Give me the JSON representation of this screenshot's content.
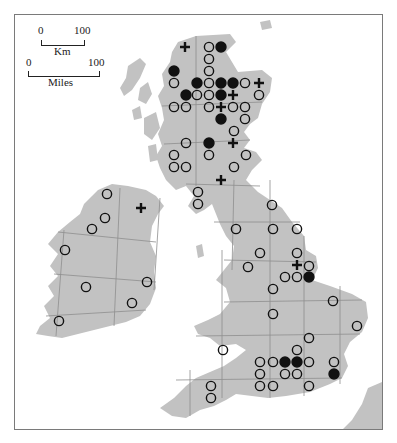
{
  "map": {
    "land_color": "#c2c2c2",
    "grid_color": "#8e8e8e",
    "frame_color": "#7a7a7a",
    "symbol_color": "#111111"
  },
  "scale_bars": {
    "km": {
      "start": "0",
      "end": "100",
      "unit": "Km"
    },
    "miles": {
      "start": "0",
      "end": "100",
      "unit": "Miles"
    }
  },
  "legend_symbols": {
    "open_circle": "open-circle",
    "filled_circle": "filled-circle",
    "plus": "plus"
  },
  "points": [
    {
      "t": "plus",
      "x": 185,
      "y": 47
    },
    {
      "t": "open",
      "x": 209,
      "y": 47
    },
    {
      "t": "filled",
      "x": 221,
      "y": 47
    },
    {
      "t": "open",
      "x": 209,
      "y": 59
    },
    {
      "t": "filled",
      "x": 174,
      "y": 71
    },
    {
      "t": "open",
      "x": 209,
      "y": 71
    },
    {
      "t": "open",
      "x": 174,
      "y": 83
    },
    {
      "t": "filled",
      "x": 197,
      "y": 83
    },
    {
      "t": "open",
      "x": 209,
      "y": 83
    },
    {
      "t": "filled",
      "x": 221,
      "y": 83
    },
    {
      "t": "filled",
      "x": 233,
      "y": 83
    },
    {
      "t": "open",
      "x": 245,
      "y": 83
    },
    {
      "t": "plus",
      "x": 259,
      "y": 83
    },
    {
      "t": "filled",
      "x": 186,
      "y": 95
    },
    {
      "t": "open",
      "x": 197,
      "y": 95
    },
    {
      "t": "open",
      "x": 209,
      "y": 95
    },
    {
      "t": "filled",
      "x": 221,
      "y": 95
    },
    {
      "t": "plus",
      "x": 233,
      "y": 95
    },
    {
      "t": "open",
      "x": 259,
      "y": 95
    },
    {
      "t": "open",
      "x": 174,
      "y": 107
    },
    {
      "t": "open",
      "x": 186,
      "y": 107
    },
    {
      "t": "open",
      "x": 209,
      "y": 107
    },
    {
      "t": "plus",
      "x": 221,
      "y": 107
    },
    {
      "t": "open",
      "x": 233,
      "y": 107
    },
    {
      "t": "open",
      "x": 245,
      "y": 107
    },
    {
      "t": "filled",
      "x": 221,
      "y": 119
    },
    {
      "t": "open",
      "x": 245,
      "y": 119
    },
    {
      "t": "open",
      "x": 234,
      "y": 131
    },
    {
      "t": "open",
      "x": 186,
      "y": 143
    },
    {
      "t": "filled",
      "x": 209,
      "y": 143
    },
    {
      "t": "plus",
      "x": 233,
      "y": 143
    },
    {
      "t": "open",
      "x": 174,
      "y": 155
    },
    {
      "t": "open",
      "x": 209,
      "y": 155
    },
    {
      "t": "open",
      "x": 246,
      "y": 155
    },
    {
      "t": "open",
      "x": 174,
      "y": 167
    },
    {
      "t": "open",
      "x": 186,
      "y": 167
    },
    {
      "t": "open",
      "x": 234,
      "y": 167
    },
    {
      "t": "plus",
      "x": 221,
      "y": 180
    },
    {
      "t": "open",
      "x": 198,
      "y": 192
    },
    {
      "t": "open",
      "x": 198,
      "y": 204
    },
    {
      "t": "open",
      "x": 107,
      "y": 194
    },
    {
      "t": "plus",
      "x": 141,
      "y": 208
    },
    {
      "t": "open",
      "x": 105,
      "y": 218
    },
    {
      "t": "open",
      "x": 92,
      "y": 229
    },
    {
      "t": "open",
      "x": 65,
      "y": 250
    },
    {
      "t": "open",
      "x": 147,
      "y": 282
    },
    {
      "t": "open",
      "x": 86,
      "y": 287
    },
    {
      "t": "open",
      "x": 132,
      "y": 303
    },
    {
      "t": "open",
      "x": 59,
      "y": 321
    },
    {
      "t": "open",
      "x": 272,
      "y": 205
    },
    {
      "t": "open",
      "x": 236,
      "y": 229
    },
    {
      "t": "open",
      "x": 273,
      "y": 229
    },
    {
      "t": "open",
      "x": 297,
      "y": 229
    },
    {
      "t": "open",
      "x": 260,
      "y": 253
    },
    {
      "t": "open",
      "x": 297,
      "y": 253
    },
    {
      "t": "plus",
      "x": 297,
      "y": 265
    },
    {
      "t": "open",
      "x": 309,
      "y": 266
    },
    {
      "t": "open",
      "x": 248,
      "y": 267
    },
    {
      "t": "open",
      "x": 285,
      "y": 277
    },
    {
      "t": "open",
      "x": 297,
      "y": 277
    },
    {
      "t": "filled",
      "x": 309,
      "y": 277
    },
    {
      "t": "open",
      "x": 273,
      "y": 289
    },
    {
      "t": "open",
      "x": 333,
      "y": 301
    },
    {
      "t": "open",
      "x": 273,
      "y": 314
    },
    {
      "t": "open",
      "x": 357,
      "y": 326
    },
    {
      "t": "open",
      "x": 309,
      "y": 338
    },
    {
      "t": "open",
      "x": 297,
      "y": 350
    },
    {
      "t": "open",
      "x": 223,
      "y": 350
    },
    {
      "t": "open",
      "x": 260,
      "y": 362
    },
    {
      "t": "open",
      "x": 273,
      "y": 362
    },
    {
      "t": "filled",
      "x": 285,
      "y": 362
    },
    {
      "t": "filled",
      "x": 297,
      "y": 362
    },
    {
      "t": "open",
      "x": 309,
      "y": 362
    },
    {
      "t": "open",
      "x": 334,
      "y": 362
    },
    {
      "t": "open",
      "x": 260,
      "y": 374
    },
    {
      "t": "open",
      "x": 285,
      "y": 374
    },
    {
      "t": "open",
      "x": 297,
      "y": 374
    },
    {
      "t": "filled",
      "x": 334,
      "y": 374
    },
    {
      "t": "open",
      "x": 211,
      "y": 386
    },
    {
      "t": "open",
      "x": 260,
      "y": 386
    },
    {
      "t": "open",
      "x": 273,
      "y": 386
    },
    {
      "t": "open",
      "x": 309,
      "y": 386
    },
    {
      "t": "open",
      "x": 211,
      "y": 398
    }
  ]
}
